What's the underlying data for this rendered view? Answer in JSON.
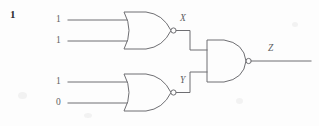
{
  "page": {
    "width": 319,
    "height": 126,
    "background_color": "#fdfdfd",
    "ink_color": "#6e6e72",
    "question_number": "1"
  },
  "diagram": {
    "type": "logic-circuit",
    "inputs": [
      {
        "id": "in1",
        "label": "1",
        "x": 60,
        "y": 20,
        "gate": "nor-gate-1",
        "pin": "a"
      },
      {
        "id": "in2",
        "label": "1",
        "x": 60,
        "y": 41,
        "gate": "nor-gate-1",
        "pin": "b"
      },
      {
        "id": "in3",
        "label": "1",
        "x": 60,
        "y": 82,
        "gate": "nor-gate-2",
        "pin": "a"
      },
      {
        "id": "in4",
        "label": "0",
        "x": 60,
        "y": 103,
        "gate": "nor-gate-2",
        "pin": "b"
      }
    ],
    "gates": [
      {
        "id": "nor-gate-1",
        "type": "NOR",
        "output_label": "X",
        "output_label_x": 175,
        "output_label_y": 19
      },
      {
        "id": "nor-gate-2",
        "type": "NOR",
        "output_label": "Y",
        "output_label_x": 175,
        "output_label_y": 81
      },
      {
        "id": "nand-gate-1",
        "type": "NAND",
        "output_label": "Z",
        "output_label_x": 268,
        "output_label_y": 43
      }
    ],
    "nodes": [
      {
        "id": "X",
        "label": "X"
      },
      {
        "id": "Y",
        "label": "Y"
      },
      {
        "id": "Z",
        "label": "Z"
      }
    ],
    "output": {
      "id": "out1",
      "label": "Z",
      "from": "nand-gate-1"
    }
  }
}
